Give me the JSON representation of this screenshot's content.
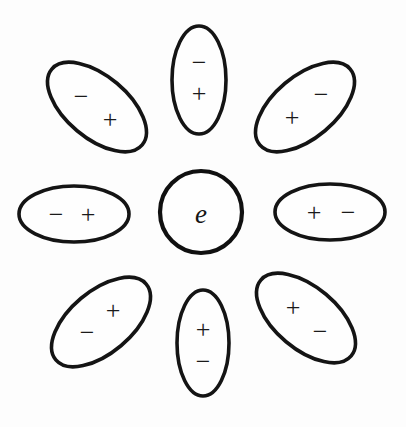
{
  "figure": {
    "background_color": "#fdfdfd",
    "stroke_color": "#141414",
    "glyph_color": "#1a1a1a",
    "core": {
      "label": "e",
      "cx": 201,
      "cy": 212,
      "rx": 41,
      "ry": 41
    },
    "dipoles": [
      {
        "id": "top-left",
        "cx": 97,
        "cy": 107,
        "rx": 59,
        "ry": 31,
        "rotation": 40,
        "negative": {
          "label": "−",
          "dx": -16,
          "dy": -11
        },
        "positive": {
          "label": "+",
          "dx": 13,
          "dy": 12
        }
      },
      {
        "id": "top-center",
        "cx": 199,
        "cy": 80,
        "rx": 27,
        "ry": 54,
        "rotation": 0,
        "negative": {
          "label": "−",
          "dx": 0,
          "dy": -18
        },
        "positive": {
          "label": "+",
          "dx": 0,
          "dy": 13
        }
      },
      {
        "id": "top-right",
        "cx": 305,
        "cy": 107,
        "rx": 59,
        "ry": 31,
        "rotation": -40,
        "negative": {
          "label": "−",
          "dx": 16,
          "dy": -13
        },
        "positive": {
          "label": "+",
          "dx": -13,
          "dy": 10
        }
      },
      {
        "id": "middle-left",
        "cx": 74,
        "cy": 214,
        "rx": 55,
        "ry": 28,
        "rotation": 0,
        "negative": {
          "label": "−",
          "dx": -18,
          "dy": 0
        },
        "positive": {
          "label": "+",
          "dx": 14,
          "dy": 0
        }
      },
      {
        "id": "middle-right",
        "cx": 330,
        "cy": 212,
        "rx": 55,
        "ry": 28,
        "rotation": 0,
        "negative": {
          "label": "−",
          "dx": 18,
          "dy": 0
        },
        "positive": {
          "label": "+",
          "dx": -16,
          "dy": 0
        }
      },
      {
        "id": "bottom-left",
        "cx": 101,
        "cy": 322,
        "rx": 59,
        "ry": 31,
        "rotation": -40,
        "negative": {
          "label": "−",
          "dx": -14,
          "dy": 10
        },
        "positive": {
          "label": "+",
          "dx": 12,
          "dy": -12
        }
      },
      {
        "id": "bottom-center",
        "cx": 203,
        "cy": 343,
        "rx": 26,
        "ry": 53,
        "rotation": 0,
        "negative": {
          "label": "−",
          "dx": 0,
          "dy": 18
        },
        "positive": {
          "label": "+",
          "dx": 0,
          "dy": -14
        }
      },
      {
        "id": "bottom-right",
        "cx": 306,
        "cy": 318,
        "rx": 59,
        "ry": 31,
        "rotation": 40,
        "negative": {
          "label": "−",
          "dx": 14,
          "dy": 13
        },
        "positive": {
          "label": "+",
          "dx": -13,
          "dy": -11
        }
      }
    ]
  }
}
